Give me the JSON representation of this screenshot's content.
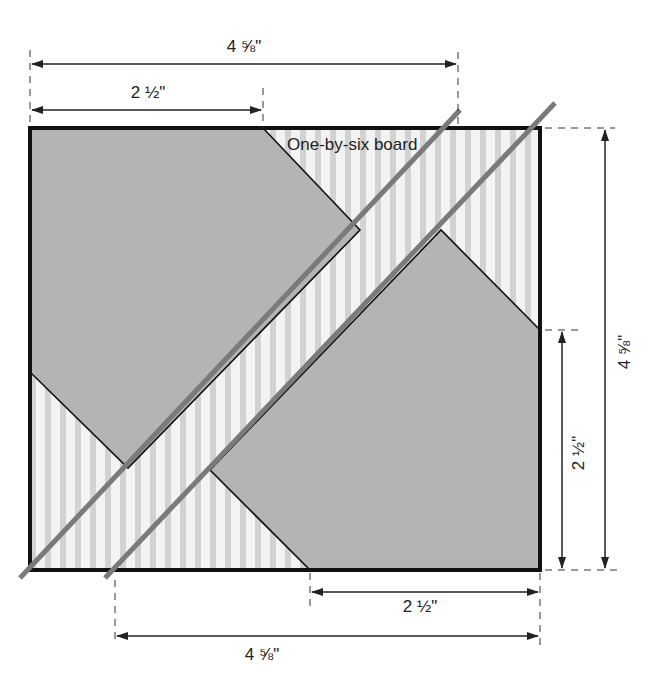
{
  "diagram": {
    "title_partial": "",
    "board_label": "One-by-six board",
    "dimensions": {
      "top_overall": "4 ⅝\"",
      "top_partial": "2 ½\"",
      "right_overall": "4 ⅝\"",
      "right_partial": "2 ½\"",
      "bottom_partial": "2 ½\"",
      "bottom_overall": "4 ⅝\""
    },
    "caption_partial": "",
    "colors": {
      "background": "#ffffff",
      "outline": "#111111",
      "gray_fill": "#b4b4b4",
      "board_fill": "#f2f2f2",
      "board_stripe": "#cfcfcf",
      "cut_line": "#7a7a7a",
      "dim_line": "#222222"
    },
    "geometry": {
      "square": {
        "x": 30,
        "y": 128,
        "w": 510,
        "h": 442
      },
      "upper_left_piece": "30,128 263,128 360,230 128,468 30,372",
      "lower_right_piece": "540,330 540,570 310,570 210,470 441,230",
      "cut_line_upper": {
        "x1": 20,
        "y1": 578,
        "x2": 460,
        "y2": 110
      },
      "cut_line_lower": {
        "x1": 105,
        "y1": 578,
        "x2": 555,
        "y2": 103
      }
    }
  }
}
